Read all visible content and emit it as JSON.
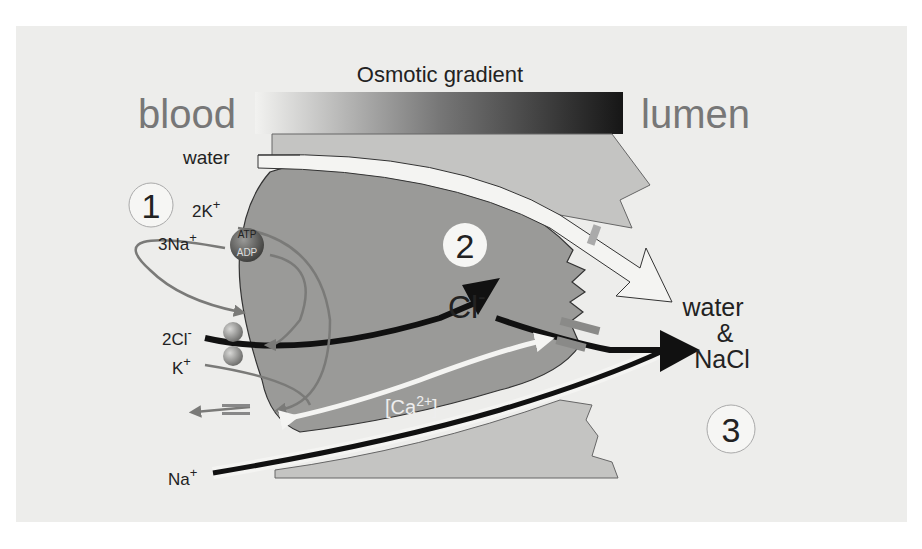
{
  "figure": {
    "title": "Osmotic gradient",
    "side_labels": {
      "left": "blood",
      "right": "lumen"
    },
    "step_markers": [
      "1",
      "2",
      "3"
    ],
    "ion_labels": {
      "water_in": "water",
      "k_pump": "2K",
      "k_pump_sup": "+",
      "na_pump": "3Na",
      "na_pump_sup": "+",
      "cl_cotransport": "2Cl",
      "cl_cotransport_sup": "-",
      "k_cotransport": "K",
      "k_cotransport_sup": "+",
      "na_paracellular": "Na",
      "na_paracellular_sup": "+",
      "cl_cell": "Cl",
      "cl_cell_sup": "-",
      "calcium": "[Ca",
      "calcium_sup": "2+",
      "calcium_close": "]",
      "atp": "ATP",
      "adp": "ADP"
    },
    "output_label": {
      "line1": "water",
      "line2": "&",
      "line3": "NaCl"
    },
    "colors": {
      "panel_bg": "#ededeb",
      "cell_fill": "#9a9a98",
      "neighbor_fill": "#c4c4c2",
      "arrow_dark": "#111111",
      "arrow_gray": "#7a7a78",
      "side_label": "#777777",
      "gradient_start": "#f2f2f0",
      "gradient_end": "#161616"
    }
  }
}
